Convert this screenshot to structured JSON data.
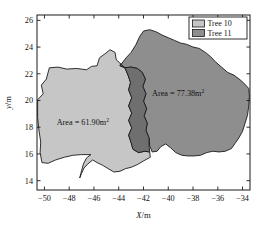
{
  "chart_data": {
    "type": "area",
    "title": "",
    "xlabel": "X/m",
    "ylabel": "y/m",
    "xlim": [
      -50.6,
      -33.4
    ],
    "ylim": [
      13.3,
      26.4
    ],
    "xticks": [
      -50,
      -48,
      -46,
      -44,
      -42,
      -40,
      -38,
      -36,
      -34
    ],
    "yticks": [
      14,
      16,
      18,
      20,
      22,
      24,
      26
    ],
    "xticklabels": [
      "−50",
      "−48",
      "−46",
      "−44",
      "−42",
      "−40",
      "−38",
      "−36",
      "−34"
    ],
    "yticklabels": [
      "14",
      "16",
      "18",
      "20",
      "22",
      "24",
      "26"
    ],
    "grid": false,
    "legend_position": "top-right",
    "series": [
      {
        "name": "Tree 10",
        "color": "#c6c6c6",
        "area_value": 61.9,
        "area_unit": "m²",
        "points": [
          [
            -50.55,
            18.72
          ],
          [
            -50.55,
            20.05
          ],
          [
            -50.1,
            20.5
          ],
          [
            -50.25,
            21.15
          ],
          [
            -49.85,
            21.6
          ],
          [
            -49.6,
            22.45
          ],
          [
            -48.9,
            22.5
          ],
          [
            -48.2,
            22.35
          ],
          [
            -47.4,
            22.4
          ],
          [
            -46.6,
            22.3
          ],
          [
            -46.2,
            22.55
          ],
          [
            -45.75,
            22.6
          ],
          [
            -45.55,
            23.2
          ],
          [
            -45.1,
            23.5
          ],
          [
            -44.7,
            23.8
          ],
          [
            -44.3,
            23.6
          ],
          [
            -44.2,
            23.05
          ],
          [
            -43.85,
            22.75
          ],
          [
            -43.5,
            22.45
          ],
          [
            -43.25,
            21.9
          ],
          [
            -43.05,
            21.35
          ],
          [
            -43.2,
            20.8
          ],
          [
            -42.95,
            20.2
          ],
          [
            -43.2,
            19.6
          ],
          [
            -42.95,
            19.05
          ],
          [
            -43.2,
            18.5
          ],
          [
            -42.95,
            17.95
          ],
          [
            -43.2,
            17.4
          ],
          [
            -43.0,
            16.85
          ],
          [
            -42.85,
            16.35
          ],
          [
            -42.4,
            16.1
          ],
          [
            -41.9,
            16.2
          ],
          [
            -41.5,
            16.15
          ],
          [
            -41.45,
            15.75
          ],
          [
            -41.95,
            15.5
          ],
          [
            -42.5,
            15.2
          ],
          [
            -43.0,
            15.0
          ],
          [
            -43.45,
            14.9
          ],
          [
            -43.9,
            14.7
          ],
          [
            -44.4,
            14.65
          ],
          [
            -44.85,
            14.9
          ],
          [
            -45.3,
            15.15
          ],
          [
            -45.75,
            15.35
          ],
          [
            -46.1,
            15.55
          ],
          [
            -46.5,
            15.25
          ],
          [
            -46.8,
            14.95
          ],
          [
            -47.0,
            14.55
          ],
          [
            -47.15,
            14.2
          ],
          [
            -47.0,
            14.75
          ],
          [
            -46.85,
            15.25
          ],
          [
            -46.6,
            15.7
          ],
          [
            -46.25,
            15.95
          ],
          [
            -47.0,
            15.95
          ],
          [
            -47.7,
            15.9
          ],
          [
            -48.4,
            15.75
          ],
          [
            -49.1,
            15.55
          ],
          [
            -49.7,
            15.3
          ],
          [
            -50.2,
            15.35
          ],
          [
            -50.35,
            16.1
          ],
          [
            -50.3,
            16.9
          ],
          [
            -50.45,
            17.8
          ]
        ]
      },
      {
        "name": "Tree 11",
        "color": "#8e8e8e",
        "area_value": 77.38,
        "area_unit": "m²",
        "points": [
          [
            -43.9,
            22.6
          ],
          [
            -43.4,
            23.2
          ],
          [
            -43.0,
            23.6
          ],
          [
            -42.6,
            24.2
          ],
          [
            -42.3,
            24.8
          ],
          [
            -42.0,
            25.2
          ],
          [
            -41.5,
            25.3
          ],
          [
            -41.0,
            25.15
          ],
          [
            -40.5,
            24.9
          ],
          [
            -40.0,
            24.7
          ],
          [
            -39.5,
            24.5
          ],
          [
            -39.0,
            24.3
          ],
          [
            -38.5,
            24.2
          ],
          [
            -38.0,
            24.0
          ],
          [
            -37.5,
            23.9
          ],
          [
            -37.0,
            23.6
          ],
          [
            -36.6,
            23.3
          ],
          [
            -36.2,
            22.9
          ],
          [
            -35.7,
            22.5
          ],
          [
            -35.2,
            22.1
          ],
          [
            -34.7,
            21.9
          ],
          [
            -34.2,
            21.55
          ],
          [
            -33.9,
            21.3
          ],
          [
            -33.5,
            20.9
          ],
          [
            -33.45,
            20.3
          ],
          [
            -33.5,
            19.6
          ],
          [
            -33.6,
            18.9
          ],
          [
            -33.8,
            18.3
          ],
          [
            -34.0,
            17.7
          ],
          [
            -34.3,
            17.2
          ],
          [
            -34.6,
            16.8
          ],
          [
            -34.9,
            16.4
          ],
          [
            -35.4,
            16.2
          ],
          [
            -35.9,
            16.15
          ],
          [
            -36.4,
            16.2
          ],
          [
            -36.9,
            16.1
          ],
          [
            -37.4,
            15.9
          ],
          [
            -37.9,
            15.85
          ],
          [
            -38.4,
            15.85
          ],
          [
            -38.9,
            15.9
          ],
          [
            -39.4,
            16.1
          ],
          [
            -39.8,
            16.45
          ],
          [
            -40.2,
            16.75
          ],
          [
            -40.6,
            16.55
          ],
          [
            -40.9,
            16.2
          ],
          [
            -41.3,
            16.15
          ],
          [
            -41.5,
            16.6
          ],
          [
            -41.55,
            17.2
          ],
          [
            -41.8,
            17.75
          ],
          [
            -41.7,
            18.3
          ],
          [
            -41.95,
            18.85
          ],
          [
            -41.75,
            19.4
          ],
          [
            -42.0,
            19.95
          ],
          [
            -41.8,
            20.5
          ],
          [
            -42.05,
            21.05
          ],
          [
            -41.85,
            21.6
          ],
          [
            -42.1,
            22.1
          ],
          [
            -42.5,
            22.4
          ],
          [
            -43.0,
            22.5
          ],
          [
            -43.5,
            22.45
          ]
        ]
      }
    ],
    "overlap": {
      "name": "overlap-region",
      "color": "#6f6f6f",
      "points": [
        [
          -43.85,
          22.75
        ],
        [
          -43.5,
          22.45
        ],
        [
          -43.25,
          21.9
        ],
        [
          -43.05,
          21.35
        ],
        [
          -43.2,
          20.8
        ],
        [
          -42.95,
          20.2
        ],
        [
          -43.2,
          19.6
        ],
        [
          -42.95,
          19.05
        ],
        [
          -43.2,
          18.5
        ],
        [
          -42.95,
          17.95
        ],
        [
          -43.2,
          17.4
        ],
        [
          -43.0,
          16.85
        ],
        [
          -42.85,
          16.35
        ],
        [
          -42.4,
          16.1
        ],
        [
          -41.9,
          16.2
        ],
        [
          -41.5,
          16.15
        ],
        [
          -41.55,
          16.6
        ],
        [
          -41.55,
          17.2
        ],
        [
          -41.8,
          17.75
        ],
        [
          -41.7,
          18.3
        ],
        [
          -41.95,
          18.85
        ],
        [
          -41.75,
          19.4
        ],
        [
          -42.0,
          19.95
        ],
        [
          -41.8,
          20.5
        ],
        [
          -42.05,
          21.05
        ],
        [
          -41.85,
          21.6
        ],
        [
          -42.1,
          22.1
        ],
        [
          -42.5,
          22.4
        ],
        [
          -43.0,
          22.5
        ],
        [
          -43.5,
          22.45
        ],
        [
          -43.9,
          22.6
        ]
      ]
    },
    "annotations": [
      {
        "name": "area-label-tree-10",
        "text": "Area = 61.90m",
        "sup": "2",
        "x": -46.9,
        "y": 18.2
      },
      {
        "name": "area-label-tree-11",
        "text": "Area = 77.38m",
        "sup": "2",
        "x": -39.2,
        "y": 20.3
      }
    ],
    "legend": {
      "entries": [
        {
          "label": "Tree 10",
          "color": "#c6c6c6"
        },
        {
          "label": "Tree 11",
          "color": "#8e8e8e"
        }
      ]
    }
  }
}
